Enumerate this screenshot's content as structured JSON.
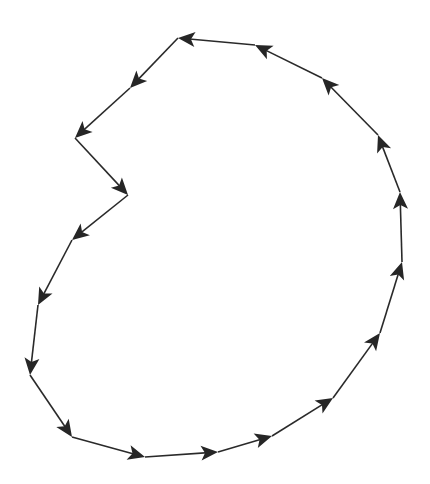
{
  "diagram": {
    "type": "closed-directed-path",
    "stroke_color": "#2a2a2a",
    "arrow_color": "#262626",
    "background": "#ffffff",
    "points": [
      [
        255,
        45
      ],
      [
        178,
        38
      ],
      [
        130,
        88
      ],
      [
        75,
        138
      ],
      [
        128,
        195
      ],
      [
        72,
        240
      ],
      [
        38,
        305
      ],
      [
        30,
        375
      ],
      [
        72,
        437
      ],
      [
        145,
        457
      ],
      [
        218,
        452
      ],
      [
        272,
        436
      ],
      [
        333,
        398
      ],
      [
        380,
        333
      ],
      [
        402,
        262
      ],
      [
        400,
        192
      ],
      [
        378,
        135
      ],
      [
        322,
        78
      ]
    ]
  }
}
